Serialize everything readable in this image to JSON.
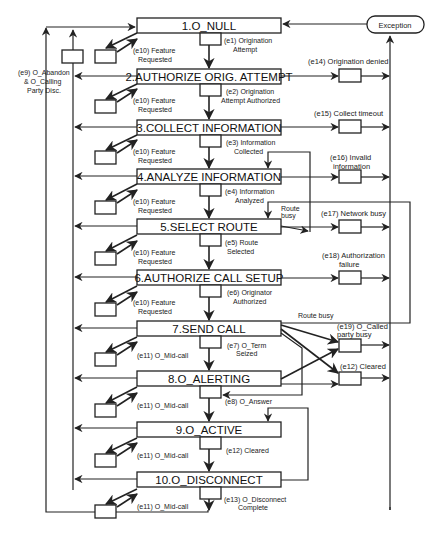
{
  "diagram": {
    "states": [
      {
        "id": 1,
        "label": "1.O_NULL"
      },
      {
        "id": 2,
        "label": "2.AUTHORIZE ORIG. ATTEMPT"
      },
      {
        "id": 3,
        "label": "3.COLLECT INFORMATION"
      },
      {
        "id": 4,
        "label": "4.ANALYZE INFORMATION"
      },
      {
        "id": 5,
        "label": "5.SELECT ROUTE"
      },
      {
        "id": 6,
        "label": "6.AUTHORIZE CALL SETUP"
      },
      {
        "id": 7,
        "label": "7.SEND CALL"
      },
      {
        "id": 8,
        "label": "8.O_ALERTING"
      },
      {
        "id": 9,
        "label": "9.O_ACTIVE"
      },
      {
        "id": 10,
        "label": "10.O_DISCONNECT"
      }
    ],
    "transitions": [
      {
        "line1": "(e1) Origination",
        "line2": "Attempt"
      },
      {
        "line1": "(e2) Origination",
        "line2": "Attempt Authorized"
      },
      {
        "line1": "(e3) Information",
        "line2": "Collected"
      },
      {
        "line1": "(e4) Information",
        "line2": "Analyzed"
      },
      {
        "line1": "(e5) Route",
        "line2": "Selected"
      },
      {
        "line1": "(e6) Originator",
        "line2": "Authorized"
      },
      {
        "line1": "(e7) O_Term",
        "line2": "Seized"
      },
      {
        "line1": "(e8) O_Answer",
        "line2": ""
      },
      {
        "line1": "(e12) Cleared",
        "line2": ""
      },
      {
        "line1": "(e13) O_Disconnect",
        "line2": "Complete"
      }
    ],
    "feature_events": {
      "e10_line1": "(e10) Feature",
      "e10_line2": "Requested",
      "e11": "(e11) O_Mid-call"
    },
    "abandon": {
      "line1": "(e9) O_Abandon",
      "line2": "& O_Calling",
      "line3": "Party Disc."
    },
    "exceptions": [
      {
        "line1": "(e14) Origination denied",
        "line2": ""
      },
      {
        "line1": "(e15) Collect timeout",
        "line2": ""
      },
      {
        "line1": "(e16) Invalid",
        "line2": "information"
      },
      {
        "line1": "(e17) Network busy",
        "line2": ""
      },
      {
        "line1": "(e18) Authorization",
        "line2": "failure"
      },
      {
        "line1": "(e19) O_Called",
        "line2": "party busy"
      },
      {
        "line1": "(e12) Cleared",
        "line2": ""
      }
    ],
    "exception_node": "Exception",
    "route_busy": {
      "label_a_line1": "Route",
      "label_a_line2": "busy",
      "label_b": "Route busy"
    }
  }
}
